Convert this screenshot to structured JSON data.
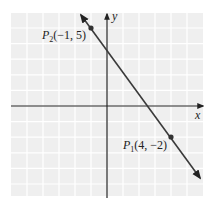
{
  "chart_data": {
    "type": "line",
    "title": "",
    "xlabel": "x",
    "ylabel": "y",
    "grid": true,
    "xlim": [
      -6,
      6
    ],
    "ylim": [
      -5.7,
      6
    ],
    "series": [
      {
        "name": "line through P1 and P2",
        "x": [
          -1,
          4
        ],
        "y": [
          5,
          -2
        ],
        "slope": -1.4,
        "arrows_both_ends": true
      }
    ],
    "points": [
      {
        "id": "P2",
        "label_main": "P",
        "label_sub": "2",
        "label_coords": "(−1, 5)",
        "x": -1,
        "y": 5
      },
      {
        "id": "P1",
        "label_main": "P",
        "label_sub": "1",
        "label_coords": "(4, −2)",
        "x": 4,
        "y": -2
      }
    ],
    "annotations": [
      "P2(−1, 5)",
      "P1(4, −2)"
    ]
  },
  "colors": {
    "background": "#ffffff",
    "grid_fill": "#efefef",
    "grid_line": "#ffffff",
    "axis": "#222222",
    "line": "#3a3a3a",
    "point": "#333333"
  },
  "axes": {
    "x_label": "x",
    "y_label": "y"
  }
}
